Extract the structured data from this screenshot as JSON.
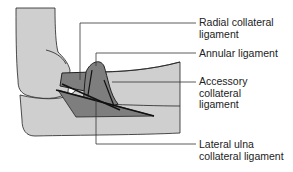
{
  "diagram": {
    "colors": {
      "bone": "#cfcfcf",
      "ligament": "#7e7e7e",
      "outline": "#222222",
      "leader": "#333333"
    },
    "labels": [
      {
        "id": "radial",
        "text": "Radial collateral\nligament"
      },
      {
        "id": "annular",
        "text": "Annular ligament"
      },
      {
        "id": "accessory",
        "text": "Accessory\ncollateral\nligament"
      },
      {
        "id": "lateral-ulna",
        "text": "Lateral ulna\ncollateral ligament"
      }
    ]
  }
}
